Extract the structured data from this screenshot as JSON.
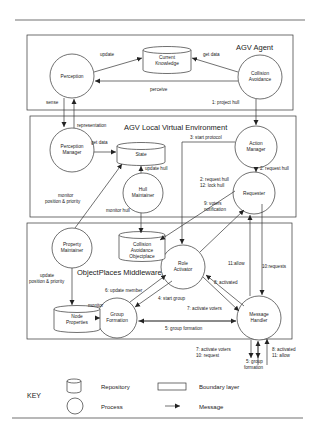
{
  "diagram": {
    "layers": [
      {
        "id": "agent",
        "title": "AGV Agent"
      },
      {
        "id": "lve",
        "title": "AGV Local Virtual Environment"
      },
      {
        "id": "middleware",
        "title": "ObjectPlaces Middleware"
      }
    ],
    "processes": {
      "perception": [
        "Perception"
      ],
      "collision_avoidance": [
        "Collision",
        "Avoidance"
      ],
      "perception_manager": [
        "Perception",
        "Manager"
      ],
      "action_manager": [
        "Action",
        "Manager"
      ],
      "hull_maintainer": [
        "Hull",
        "Maintainer"
      ],
      "requester": [
        "Requester"
      ],
      "property_maintainer": [
        "Property",
        "Maintainer"
      ],
      "role_activator": [
        "Role",
        "Activator"
      ],
      "group_formation": [
        "Group",
        "Formation"
      ],
      "message_handler": [
        "Message",
        "Handler"
      ]
    },
    "repositories": {
      "current_knowledge": [
        "Current",
        "Knowledge"
      ],
      "state": [
        "State"
      ],
      "ca_objectplace": [
        "Collision",
        "Avoidance",
        "Objectplace"
      ],
      "node_properties": [
        "Node",
        "Properties"
      ]
    },
    "messages": {
      "update": "update",
      "get_data_1": "get data",
      "perceive": "perceive",
      "sense": "sense",
      "project_hull": "1: project hull",
      "representation": "representation",
      "get_data_2": "get data",
      "start_protocol": "3: start protocol",
      "request_hull_2": "2: request hull",
      "update_hull": "update hull",
      "request_lock": [
        "2: request hull",
        "12: lock hull"
      ],
      "monitor_pp": [
        "monitor",
        "position & priority"
      ],
      "voters_notif": [
        "9: voters",
        "notification"
      ],
      "monitor_hull": "monitor hull",
      "update_pp": [
        "update",
        "position & priority"
      ],
      "monitor": "monitor",
      "update_member": "6: update member",
      "start_group": "4: start group",
      "activated_8": "8: activated",
      "activate_voters": "7: activate voters",
      "allow_11": "11:allow",
      "requests_10": "10:requests",
      "group_formation_5": "5: group formation",
      "ext_left": [
        "7: activate voters",
        "10: request"
      ],
      "ext_mid": [
        "5: group",
        "formation"
      ],
      "ext_right": [
        "8: activated",
        "11: allow"
      ]
    }
  },
  "key": {
    "title": "KEY",
    "repository": "Repository",
    "process": "Process",
    "boundary": "Boundary layer",
    "message": "Message"
  }
}
